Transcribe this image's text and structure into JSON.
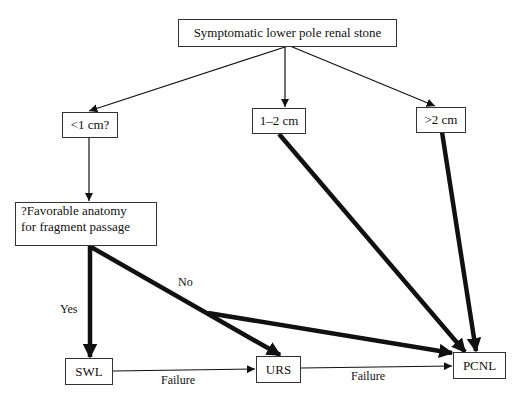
{
  "nodes": {
    "root": "Symptomatic lower pole renal stone",
    "lt1": "<1 cm?",
    "mid": "1–2 cm",
    "gt2": ">2 cm",
    "anatomy_line1": "?Favorable anatomy",
    "anatomy_line2": "for fragment passage",
    "swl": "SWL",
    "urs": "URS",
    "pcnl": "PCNL"
  },
  "edge_labels": {
    "yes": "Yes",
    "no": "No",
    "failure1": "Failure",
    "failure2": "Failure"
  }
}
